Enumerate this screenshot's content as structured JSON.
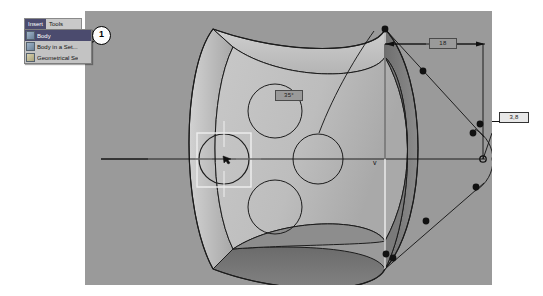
{
  "app": {
    "title": "CAD 3D viewport",
    "viewport_background": "#9a9a9a",
    "page_background": "#ffffff"
  },
  "menu": {
    "bar_items": [
      {
        "label": "Insert",
        "selected": true
      },
      {
        "label": "Tools",
        "selected": false
      }
    ],
    "dropdown_items": [
      {
        "label": "Body",
        "icon": "body-icon",
        "selected": true
      },
      {
        "label": "Body in a Set...",
        "icon": "body-in-a-set-icon",
        "selected": false
      },
      {
        "label": "Geometrical Se",
        "icon": "geometrical-set-icon",
        "selected": false
      }
    ]
  },
  "callouts": [
    {
      "number": "1"
    }
  ],
  "annotations": {
    "length_dimension": "18",
    "angle_dimension": "35°",
    "radius_dimension": "3,8"
  },
  "axis": {
    "label": "v"
  },
  "geometry": {
    "circle_holes": 3,
    "selection_box": "center-hole-selected",
    "control_points": 12,
    "colors": {
      "face_light": "#c4c4c4",
      "face_mid": "#b0b0b0",
      "face_dark": "#7b7b7b",
      "face_shadow": "#6e6e6e",
      "outline": "#1c1c1c",
      "selection": "#efefef"
    }
  }
}
